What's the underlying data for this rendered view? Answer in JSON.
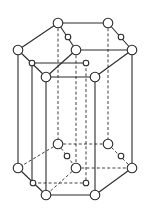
{
  "diagram": {
    "type": "hexagonal-close-packed-unit-cell",
    "stroke_color": "#2b2b2b",
    "fill_color": "#ffffff",
    "top_atoms": {
      "large": [
        [
          58,
          23
        ],
        [
          108,
          23
        ],
        [
          18,
          50
        ],
        [
          76,
          50
        ],
        [
          132,
          50
        ],
        [
          46,
          77
        ],
        [
          95,
          77
        ]
      ],
      "small": [
        [
          68,
          37
        ],
        [
          121,
          37
        ],
        [
          32,
          63
        ],
        [
          86,
          63
        ]
      ]
    },
    "bottom_atoms": {
      "large": [
        [
          58,
          144
        ],
        [
          108,
          144
        ],
        [
          18,
          168
        ],
        [
          76,
          168
        ],
        [
          132,
          168
        ],
        [
          46,
          195
        ],
        [
          95,
          195
        ]
      ],
      "small": [
        [
          67,
          156
        ],
        [
          121,
          156
        ],
        [
          33,
          183
        ],
        [
          86,
          183
        ]
      ]
    },
    "top_edges_solid": [
      [
        58,
        23,
        108,
        23
      ],
      [
        58,
        23,
        18,
        50
      ],
      [
        58,
        23,
        76,
        50
      ],
      [
        18,
        50,
        46,
        77
      ],
      [
        46,
        77,
        95,
        77
      ],
      [
        95,
        77,
        132,
        50
      ],
      [
        132,
        50,
        108,
        23
      ],
      [
        76,
        50,
        132,
        50
      ],
      [
        76,
        50,
        46,
        77
      ],
      [
        32,
        63,
        86,
        63
      ]
    ],
    "bottom_edges_solid": [
      [
        18,
        168,
        46,
        195
      ],
      [
        46,
        195,
        95,
        195
      ],
      [
        95,
        195,
        132,
        168
      ]
    ],
    "bottom_edges_dashed": [
      [
        58,
        144,
        108,
        144
      ],
      [
        58,
        144,
        18,
        168
      ],
      [
        58,
        144,
        76,
        168
      ],
      [
        76,
        168,
        132,
        168
      ],
      [
        132,
        168,
        108,
        144
      ],
      [
        76,
        168,
        46,
        195
      ],
      [
        33,
        183,
        86,
        183
      ]
    ],
    "verticals_solid": [
      [
        18,
        50,
        168
      ],
      [
        32,
        63,
        183
      ],
      [
        46,
        77,
        195
      ],
      [
        95,
        77,
        195
      ],
      [
        132,
        50,
        168
      ]
    ],
    "verticals_dashed": [
      [
        58,
        23,
        144
      ],
      [
        76,
        50,
        168
      ],
      [
        86,
        63,
        183
      ],
      [
        108,
        23,
        144
      ]
    ]
  }
}
